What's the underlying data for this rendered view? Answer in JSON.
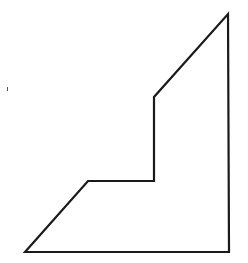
{
  "figure": {
    "background": "#ffffff",
    "stroke_color": "#1a1a1a",
    "stroke_width": 2.2,
    "shape": {
      "name": "stepped-right-polygon",
      "vertices": [
        [
          25,
          252
        ],
        [
          88,
          181
        ],
        [
          154,
          181
        ],
        [
          154,
          97
        ],
        [
          228,
          14
        ],
        [
          229,
          252
        ]
      ]
    },
    "stray_mark": {
      "x": 7,
      "y": 87
    }
  }
}
